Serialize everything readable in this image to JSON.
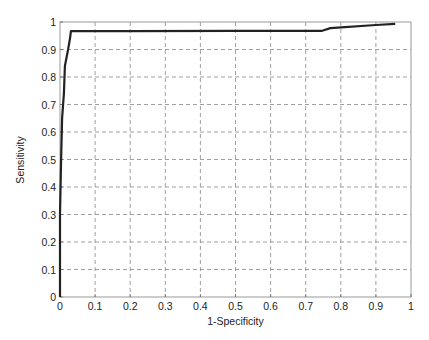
{
  "chart_data": {
    "type": "line",
    "title": "",
    "xlabel": "1-Specificity",
    "ylabel": "Sensitivity",
    "xlim": [
      0,
      1
    ],
    "ylim": [
      0,
      1
    ],
    "grid": true,
    "legend": null,
    "xticks": [
      "0",
      "0.1",
      "0.2",
      "0.3",
      "0.4",
      "0.5",
      "0.6",
      "0.7",
      "0.8",
      "0.9",
      "1"
    ],
    "yticks": [
      "0",
      "0.1",
      "0.2",
      "0.3",
      "0.4",
      "0.5",
      "0.6",
      "0.7",
      "0.8",
      "0.9",
      "1"
    ],
    "series": [
      {
        "name": "ROC curve",
        "color": "#222222",
        "x": [
          0.0,
          0.0,
          0.003,
          0.006,
          0.011,
          0.014,
          0.023,
          0.029,
          0.031,
          0.2,
          0.5,
          0.747,
          0.77,
          0.9,
          0.955
        ],
        "y": [
          0.0,
          0.3,
          0.5,
          0.65,
          0.74,
          0.84,
          0.9,
          0.945,
          0.967,
          0.967,
          0.968,
          0.968,
          0.978,
          0.989,
          0.993
        ]
      }
    ]
  }
}
